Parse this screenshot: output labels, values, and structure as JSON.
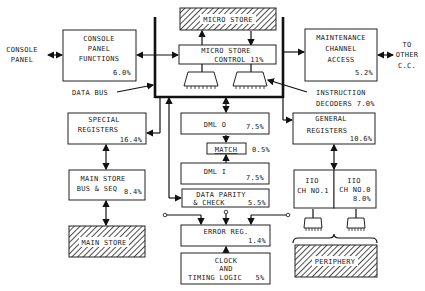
{
  "diagram": {
    "external_labels": {
      "console_panel": [
        "CONSOLE",
        "PANEL"
      ],
      "to_other_cc": [
        "TO",
        "OTHER",
        "C.C."
      ],
      "data_bus": "DATA BUS",
      "instruction_decoders": [
        "INSTRUCTION",
        "DECODERS 7.0%"
      ]
    },
    "blocks": {
      "console_panel_functions": {
        "lines": [
          "CONSOLE",
          "PANEL",
          "FUNCTIONS"
        ],
        "pct": "6.0%"
      },
      "micro_store": {
        "label": "MICRO STORE",
        "hatched": true
      },
      "micro_store_control": {
        "lines": [
          "MICRO STORE",
          "CONTROL 11%"
        ]
      },
      "maintenance_channel_access": {
        "lines": [
          "MAINTENANCE",
          "CHANNEL",
          "ACCESS"
        ],
        "pct": "5.2%"
      },
      "special_registers": {
        "lines": [
          "SPECIAL",
          "REGISTERS"
        ],
        "pct": "16.4%"
      },
      "main_store_bus_seq": {
        "lines": [
          "MAIN STORE",
          "BUS & SEQ"
        ],
        "pct": "8.4%"
      },
      "main_store": {
        "label": "MAIN STORE",
        "hatched": true
      },
      "dml0": {
        "label": "DML O",
        "pct": "7.5%"
      },
      "match": {
        "label": "MATCH",
        "pct": "0.5%"
      },
      "dml1": {
        "label": "DML I",
        "pct": "7.5%"
      },
      "data_parity_check": {
        "lines": [
          "DATA PARITY",
          "& CHECK"
        ],
        "pct": "5.5%"
      },
      "error_reg": {
        "label": "ERROR REG.",
        "pct": "1.4%"
      },
      "clock_timing": {
        "lines": [
          "CLOCK",
          "AND",
          "TIMING LOGIC"
        ],
        "pct": "5%"
      },
      "general_registers": {
        "lines": [
          "GENERAL",
          "REGISTERS"
        ],
        "pct": "10.6%"
      },
      "io_ch1": {
        "lines": [
          "IIO",
          "CH NO.1"
        ]
      },
      "io_ch0": {
        "lines": [
          "IIO",
          "CH NO.0"
        ],
        "pct": "8.0%"
      },
      "periphery": {
        "label": "PERIPHERY",
        "hatched": true
      }
    }
  }
}
